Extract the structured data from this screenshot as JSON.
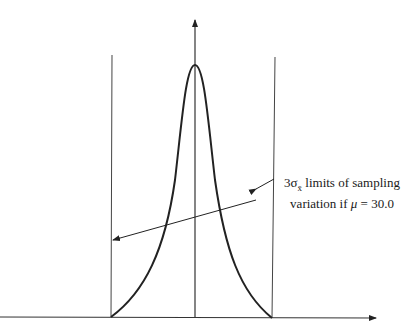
{
  "diagram": {
    "type": "sampling-distribution-control-limits",
    "annotation": {
      "line1_prefix": "3σ",
      "line1_sub": "x̄",
      "line1_suffix": " limits of sampling",
      "line2_prefix": "variation if ",
      "line2_mu": "μ",
      "line2_suffix": " = 30.0"
    },
    "colors": {
      "stroke": "#222222",
      "background": "#ffffff"
    }
  }
}
